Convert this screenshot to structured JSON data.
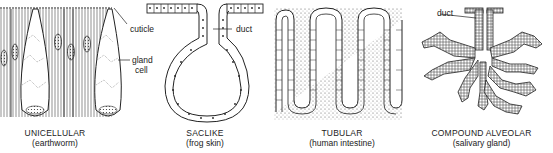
{
  "figure": {
    "panels": [
      {
        "id": "unicellular",
        "title": "UNICELLULAR",
        "subtitle": "(earthworm)",
        "labels": {
          "cuticle": "cuticle",
          "gland_cell_1": "gland",
          "gland_cell_2": "cell"
        }
      },
      {
        "id": "saclike",
        "title": "SACLIKE",
        "subtitle": "(frog skin)",
        "labels": {
          "duct": "duct"
        }
      },
      {
        "id": "tubular",
        "title": "TUBULAR",
        "subtitle": "(human intestine)",
        "labels": {}
      },
      {
        "id": "compound-alveolar",
        "title": "COMPOUND ALVEOLAR",
        "subtitle": "(salivary gland)",
        "labels": {
          "duct": "duct"
        }
      }
    ],
    "colors": {
      "ink": "#222222",
      "background": "#ffffff"
    }
  }
}
